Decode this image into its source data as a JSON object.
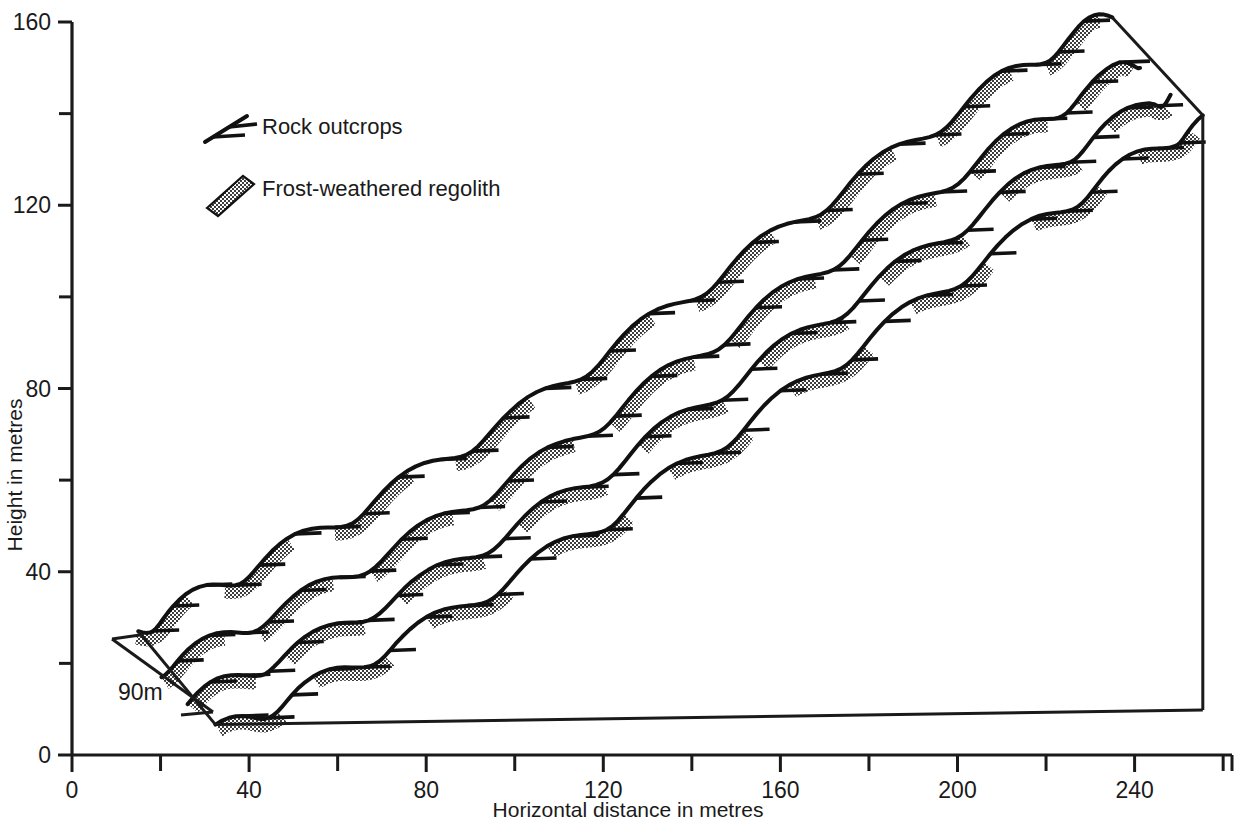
{
  "figure": {
    "type": "block-diagram"
  },
  "axes": {
    "y": {
      "title": "Height in metres",
      "labels": [
        "0",
        "40",
        "80",
        "120",
        "160"
      ],
      "label_values": [
        0,
        40,
        80,
        120,
        160
      ],
      "tick_values": [
        0,
        20,
        40,
        60,
        80,
        100,
        120,
        140,
        160
      ],
      "range": [
        0,
        160
      ]
    },
    "x": {
      "title": "Horizontal distance in metres",
      "labels": [
        "0",
        "40",
        "80",
        "120",
        "160",
        "200",
        "240"
      ],
      "label_values": [
        0,
        40,
        80,
        120,
        160,
        200,
        240
      ],
      "tick_values": [
        0,
        20,
        40,
        60,
        80,
        100,
        120,
        140,
        160,
        180,
        200,
        220,
        240,
        260
      ],
      "range": [
        0,
        262
      ]
    }
  },
  "legend": {
    "items": [
      {
        "key": "rock-outcrops",
        "label": "Rock outcrops",
        "symbol": "barbed-line"
      },
      {
        "key": "frost-weathered-regolith",
        "label": "Frost-weathered regolith",
        "symbol": "stippled-band"
      }
    ]
  },
  "depth_scale": {
    "label": "90m",
    "value": 90,
    "unit": "m"
  },
  "colors": {
    "line": "#111111",
    "text": "#1a1a1a",
    "stipple": "#4a4a4a",
    "background": "#ffffff"
  },
  "chart_data": {
    "type": "line",
    "title": "",
    "xlabel": "Horizontal distance in metres",
    "ylabel": "Height in metres",
    "xlim": [
      0,
      262
    ],
    "ylim": [
      0,
      160
    ],
    "grid": false,
    "legend": [
      "Rock outcrops",
      "Frost-weathered regolith"
    ],
    "legend_position": "upper-left",
    "projection": {
      "kind": "oblique",
      "depth_metres": 90,
      "offset_px_per_profile": {
        "x": 22,
        "y": 26
      },
      "profile_count": 4
    },
    "series": [
      {
        "name": "Profile 1 (back)",
        "x": [
          14,
          22,
          31,
          41,
          52,
          64,
          76,
          88,
          100,
          112,
          124,
          136,
          148,
          160,
          172,
          184,
          196,
          208,
          218,
          228,
          234
        ],
        "y": [
          27,
          31,
          36,
          41,
          47,
          53,
          60,
          67,
          74,
          82,
          90,
          98,
          106,
          114,
          122,
          130,
          138,
          146,
          152,
          158,
          161
        ]
      },
      {
        "name": "Profile 2",
        "x": [
          20,
          29,
          39,
          50,
          61,
          73,
          85,
          97,
          109,
          121,
          133,
          145,
          157,
          169,
          181,
          193,
          205,
          216,
          226,
          236,
          241
        ],
        "y": [
          19,
          23,
          28,
          33,
          39,
          45,
          52,
          59,
          66,
          74,
          82,
          90,
          98,
          106,
          114,
          122,
          130,
          137,
          143,
          149,
          152
        ]
      },
      {
        "name": "Profile 3",
        "x": [
          27,
          36,
          46,
          57,
          68,
          80,
          92,
          104,
          116,
          128,
          140,
          152,
          164,
          176,
          188,
          200,
          212,
          223,
          233,
          243,
          249
        ],
        "y": [
          12,
          16,
          21,
          26,
          32,
          38,
          45,
          52,
          59,
          67,
          75,
          83,
          91,
          99,
          107,
          115,
          123,
          130,
          136,
          142,
          145
        ]
      },
      {
        "name": "Profile 4 (front)",
        "x": [
          33,
          42,
          52,
          63,
          74,
          86,
          98,
          110,
          122,
          134,
          146,
          158,
          170,
          182,
          194,
          206,
          218,
          229,
          239,
          249,
          256
        ],
        "y": [
          5,
          9,
          14,
          19,
          25,
          31,
          38,
          45,
          52,
          60,
          68,
          76,
          84,
          92,
          100,
          108,
          116,
          123,
          129,
          135,
          138
        ]
      }
    ]
  }
}
